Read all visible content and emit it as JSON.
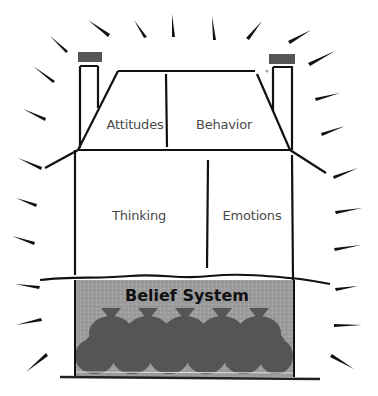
{
  "diagram": {
    "colors": {
      "line": "#111111",
      "chimney_cap": "#555555",
      "basement_fill": "#9a9a9a",
      "sack_fill": "#555555",
      "text": "#4a4a4a",
      "basement_text": "#111111"
    },
    "roof": {
      "left_room": {
        "label": "Attitudes"
      },
      "right_room": {
        "label": "Behavior"
      }
    },
    "main_floor": {
      "left_room": {
        "label": "Thinking"
      },
      "right_room": {
        "label": "Emotions"
      }
    },
    "basement": {
      "label": "Belief System",
      "sacks_top_row": 5,
      "sacks_bottom_row": 6
    },
    "chimneys": [
      {
        "name": "left-chimney"
      },
      {
        "name": "right-chimney"
      }
    ],
    "rays": {
      "description": "radiating glow strokes around the house",
      "count": 22
    }
  }
}
